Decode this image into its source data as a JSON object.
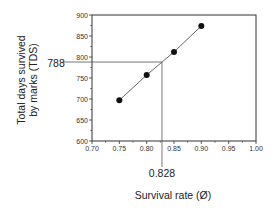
{
  "chart_data": {
    "type": "line",
    "title": "",
    "xlabel": "Survival rate (Ø)",
    "ylabel_lines": [
      "Total days survived",
      "by marks (TDS)"
    ],
    "ylabel": "Total days survived by marks (TDS)",
    "xlim": [
      0.7,
      1.0
    ],
    "ylim": [
      600,
      900
    ],
    "xticks": [
      "0.70",
      "0.75",
      "0.80",
      "0.85",
      "0.90",
      "0.95",
      "1.00"
    ],
    "yticks": [
      "600",
      "650",
      "700",
      "750",
      "800",
      "850",
      "900"
    ],
    "grid": false,
    "legend": null,
    "series": [
      {
        "name": "TDS vs survival rate",
        "marker": "filled-circle",
        "x": [
          0.75,
          0.8,
          0.85,
          0.9
        ],
        "y": [
          697,
          757,
          812,
          874
        ]
      }
    ],
    "annotations": [
      {
        "type": "hline",
        "label": "788",
        "value": 788,
        "x_end": 0.828
      },
      {
        "type": "vline",
        "label": "0.828",
        "value": 0.828,
        "y_end": 788
      }
    ]
  },
  "colors": {
    "line": "#555555",
    "marker": "#111111",
    "axis": "#333333",
    "text": "#222222"
  }
}
